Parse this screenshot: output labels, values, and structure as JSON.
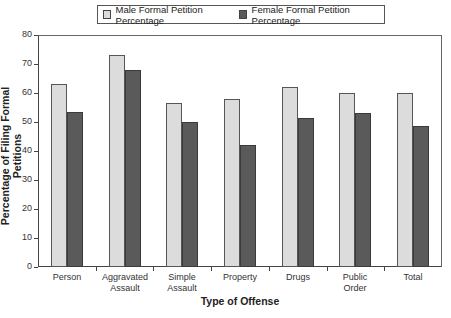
{
  "chart_data": {
    "type": "bar",
    "title": "",
    "xlabel": "Type of Offense",
    "ylabel": "Percentage of Filing Formal Petitions",
    "ylim": [
      0,
      80
    ],
    "yticks": [
      0,
      10,
      20,
      30,
      40,
      50,
      60,
      70,
      80
    ],
    "grid": false,
    "legend_position": "top",
    "categories": [
      "Person",
      "Aggravated Assault",
      "Simple Assault",
      "Property",
      "Drugs",
      "Public Order",
      "Total"
    ],
    "category_lines": [
      [
        "Person"
      ],
      [
        "Aggravated",
        "Assault"
      ],
      [
        "Simple",
        "Assault"
      ],
      [
        "Property"
      ],
      [
        "Drugs"
      ],
      [
        "Public",
        "Order"
      ],
      [
        "Total"
      ]
    ],
    "series": [
      {
        "name": "Male Formal Petition Percentage",
        "color": "#dcdcdc",
        "values": [
          63,
          73,
          56.5,
          58,
          62,
          60,
          60
        ]
      },
      {
        "name": "Female Formal Petition Percentage",
        "color": "#5a5a5a",
        "values": [
          53.5,
          68,
          50,
          42,
          51.5,
          53,
          48.5
        ]
      }
    ]
  },
  "legend": {
    "male_label": "Male Formal Petition Percentage",
    "female_label": "Female Formal Petition Percentage"
  },
  "axes": {
    "x_title": "Type of Offense",
    "y_title": "Percentage of Filing Formal Petitions",
    "y_ticks": [
      "0",
      "10",
      "20",
      "30",
      "40",
      "50",
      "60",
      "70",
      "80"
    ]
  }
}
